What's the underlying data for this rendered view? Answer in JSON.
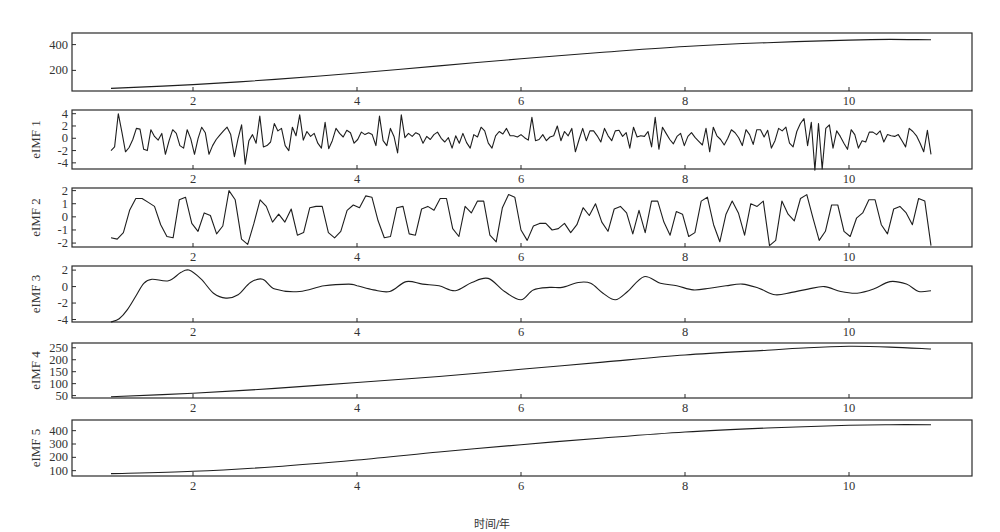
{
  "chart_data": {
    "type": "line",
    "title": "",
    "xlabel": "时间/年",
    "xlim": [
      0.0,
      11.3
    ],
    "xticks": [
      2,
      4,
      6,
      8,
      10
    ],
    "panels": [
      {
        "name": "original",
        "ylabel": "",
        "ylim": [
          40,
          490
        ],
        "yticks": [
          200,
          400
        ],
        "x": [
          1,
          2,
          3,
          4,
          5,
          6,
          7,
          8,
          9,
          10,
          10.5,
          11
        ],
        "values": [
          60,
          90,
          130,
          180,
          235,
          290,
          340,
          385,
          415,
          435,
          440,
          437
        ]
      },
      {
        "name": "eIMF1",
        "ylabel": "eIMF 1",
        "ylim": [
          -5,
          4.6
        ],
        "yticks": [
          -4,
          -2,
          0,
          2,
          4
        ],
        "x_start": 1.0,
        "x_end": 11.0,
        "values": [
          -2,
          -1.4,
          4,
          1,
          -2.2,
          -1.5,
          -0.2,
          1.6,
          1.5,
          -1.8,
          -2,
          1.4,
          0.3,
          -0.3,
          0.8,
          -2.6,
          -0.4,
          1.4,
          0.8,
          -1.2,
          -1.6,
          1.4,
          -0.1,
          -2.6,
          0,
          1.8,
          0.9,
          -2.6,
          -1.2,
          -0.2,
          0.5,
          1.2,
          1.8,
          0.6,
          -3,
          -0.1,
          2.2,
          -4.2,
          -0.4,
          0.6,
          -0.8,
          3.6,
          -1.4,
          -1.2,
          -0.6,
          2.4,
          1.2,
          1.6,
          -1.2,
          -2,
          1.8,
          0.4,
          3.8,
          -0.3,
          1.1,
          0.3,
          0.8,
          -0.8,
          -1.6,
          2.6,
          -1.7,
          -0.4,
          1.6,
          0.8,
          0.2,
          1.3,
          0.9,
          -0.8,
          -0.2,
          1,
          0.6,
          0.9,
          0.6,
          -1.2,
          3.6,
          -0.4,
          -1.2,
          1.6,
          0.3,
          -2.4,
          3.8,
          0.1,
          0.8,
          0.3,
          0.9,
          0.6,
          -0.8,
          0.3,
          -0.2,
          0.6,
          1,
          0,
          -0.6,
          0.1,
          -1.6,
          0.4,
          -0.8,
          0.8,
          -0.7,
          -1.6,
          0.6,
          0.2,
          1.8,
          1.2,
          -0.8,
          -1.6,
          0.4,
          1.1,
          0.7,
          1.6,
          0.4,
          0.4,
          0.2,
          0.6,
          0.1,
          -0.3,
          3.4,
          -0.4,
          -0.2,
          0.6,
          -0.4,
          0.2,
          0.4,
          2,
          -0.4,
          1.1,
          0.4,
          1.6,
          -2.2,
          -0.2,
          1.6,
          -0.4,
          1.2,
          1.2,
          0.4,
          -0.6,
          1.6,
          0.4,
          -0.4,
          1.2,
          1.3,
          0.3,
          0.9,
          -1.6,
          1.8,
          0.2,
          0.4,
          0.3,
          1.1,
          -1.4,
          3.4,
          -1.8,
          1.8,
          0.8,
          -0.2,
          -0.9,
          0.3,
          0.8,
          -1.2,
          0.3,
          0.9,
          0.1,
          -0.5,
          -1.1,
          1.6,
          -2.2,
          1.8,
          0.4,
          -0.2,
          -1.1,
          0,
          1.4,
          0.9,
          0.1,
          -1.2,
          1.4,
          0.6,
          -1,
          1.4,
          1.4,
          0.2,
          1.3,
          -1.6,
          -0.4,
          1.6,
          1.2,
          1.8,
          -0.8,
          -1.4,
          1.1,
          2.4,
          3.2,
          -1.2,
          2.6,
          -5.2,
          2.4,
          -5.0,
          1.6,
          2.2,
          -1.6,
          1.2,
          0.3,
          -0.8,
          -1.8,
          1.4,
          0.6,
          -1.6,
          -0.4,
          -0.6,
          1,
          1,
          0.6,
          1.2,
          -0.6,
          0.6,
          0.4,
          0.3,
          0.6,
          -0.4,
          -1.4,
          1.6,
          1.1,
          0.4,
          -0.8,
          -2.2,
          1.3,
          -2.6
        ]
      },
      {
        "name": "eIMF2",
        "ylabel": "eIMF 2",
        "ylim": [
          -2.3,
          2.2
        ],
        "yticks": [
          -2,
          -1,
          0,
          1,
          2
        ],
        "x_start": 1.0,
        "x_end": 11.0,
        "values": [
          -1.6,
          -1.7,
          -1.2,
          0.5,
          1.4,
          1.4,
          1.1,
          0.8,
          -0.6,
          -1.5,
          -1.6,
          1.3,
          1.5,
          -0.5,
          -1.1,
          0.3,
          0.1,
          -1.3,
          -0.7,
          2,
          1.3,
          -1.7,
          -2.1,
          -0.5,
          1.3,
          0.8,
          -0.4,
          0.2,
          -0.4,
          0.6,
          -1.4,
          -1.2,
          0.7,
          0.8,
          0.8,
          -1.2,
          -1.6,
          -1.1,
          0.5,
          0.9,
          0.7,
          1.6,
          1.5,
          -0.3,
          -1.6,
          -1.5,
          0.7,
          0.8,
          -1.3,
          -1.4,
          0.6,
          0.8,
          0.5,
          1.4,
          1.4,
          -0.9,
          -1.5,
          0.8,
          0.3,
          1.2,
          1.2,
          -1.4,
          -1.9,
          0.7,
          1.7,
          1.5,
          -1,
          -1.8,
          -0.7,
          -0.5,
          -0.5,
          -1,
          -0.9,
          -0.5,
          -1.2,
          -0.6,
          0.7,
          0.1,
          1,
          -0.4,
          -1.1,
          0.6,
          0.8,
          0.3,
          -1.3,
          0.5,
          -1.2,
          1.2,
          1.2,
          -0.4,
          -1.4,
          0.4,
          0.2,
          -1.5,
          -1.2,
          1.2,
          1.5,
          -0.6,
          -1.9,
          0.2,
          1.2,
          0.3,
          -1.4,
          1,
          0.8,
          1.2,
          -2.2,
          -1.8,
          1.2,
          0.2,
          -0.3,
          1.4,
          1.7,
          -0.1,
          -1.8,
          -1.1,
          0.9,
          0.9,
          -1.1,
          -1.5,
          -0.1,
          0.3,
          1.3,
          1.3,
          -0.6,
          -1.3,
          0.6,
          0.8,
          0.3,
          -0.6,
          1.4,
          1.2,
          -2.2
        ]
      },
      {
        "name": "eIMF3",
        "ylabel": "eIMF 3",
        "ylim": [
          -4.3,
          2.5
        ],
        "yticks": [
          -4,
          -2,
          0,
          2
        ],
        "x": [
          1.0,
          1.1,
          1.2,
          1.3,
          1.4,
          1.5,
          1.7,
          1.85,
          1.95,
          2.1,
          2.25,
          2.4,
          2.55,
          2.7,
          2.85,
          3.0,
          3.3,
          3.6,
          3.9,
          4.0,
          4.2,
          4.4,
          4.6,
          4.8,
          5.0,
          5.2,
          5.4,
          5.6,
          5.8,
          6.0,
          6.15,
          6.35,
          6.5,
          6.7,
          6.85,
          7.0,
          7.15,
          7.3,
          7.5,
          7.7,
          7.9,
          8.1,
          8.3,
          8.5,
          8.7,
          8.9,
          9.1,
          9.3,
          9.5,
          9.7,
          9.9,
          10.1,
          10.3,
          10.5,
          10.7,
          10.85,
          11.0
        ],
        "values": [
          -4.3,
          -3.9,
          -2.8,
          -1.2,
          0.4,
          0.9,
          0.7,
          1.7,
          2.0,
          0.9,
          -0.8,
          -1.4,
          -1.0,
          0.5,
          0.9,
          -0.3,
          -0.6,
          0.1,
          0.3,
          0.1,
          -0.4,
          -0.6,
          0.6,
          0.3,
          0.1,
          -0.5,
          0.5,
          1.0,
          -0.6,
          -1.6,
          -0.4,
          -0.1,
          -0.1,
          0.5,
          0.4,
          -0.8,
          -1.6,
          -0.6,
          1.2,
          0.4,
          0.1,
          -0.4,
          -0.2,
          0.1,
          0.3,
          -0.2,
          -1.0,
          -0.7,
          -0.3,
          0.0,
          -0.6,
          -0.8,
          -0.3,
          0.6,
          0.3,
          -0.6,
          -0.5
        ]
      },
      {
        "name": "eIMF4",
        "ylabel": "eIMF 4",
        "ylim": [
          40,
          270
        ],
        "yticks": [
          50,
          100,
          150,
          200,
          250
        ],
        "x": [
          1,
          2,
          3,
          4,
          5,
          6,
          7,
          8,
          9,
          9.5,
          10,
          10.5,
          11
        ],
        "values": [
          45,
          60,
          80,
          105,
          130,
          160,
          190,
          220,
          240,
          250,
          256,
          253,
          245
        ]
      },
      {
        "name": "eIMF5",
        "ylabel": "eIMF 5",
        "ylim": [
          60,
          480
        ],
        "yticks": [
          100,
          200,
          300,
          400
        ],
        "x": [
          1,
          2,
          3,
          4,
          5,
          6,
          7,
          8,
          9,
          10,
          10.5,
          11
        ],
        "values": [
          78,
          95,
          130,
          180,
          240,
          295,
          345,
          390,
          420,
          440,
          445,
          445
        ]
      }
    ]
  },
  "figure": {
    "xlabel": "时间/年",
    "panel_labels": [
      "",
      "eIMF 1",
      "eIMF 2",
      "eIMF 3",
      "eIMF 4",
      "eIMF 5"
    ]
  }
}
